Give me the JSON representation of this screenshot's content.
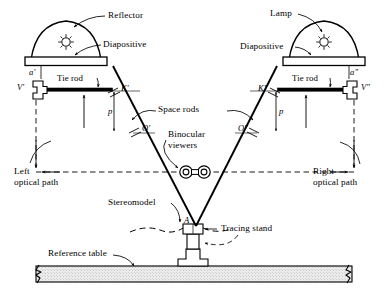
{
  "figure": {
    "background_color": "#ffffff",
    "ink_color": "#000000",
    "table_fill_color": "#e8e8e8"
  },
  "callouts": {
    "reflector": "Reflector",
    "lamp": "Lamp",
    "diapositive_left": "Diapositive",
    "diapositive_right": "Diapositive",
    "tie_rod_left": "Tie rod",
    "tie_rod_right": "Tie rod",
    "space_rods": "Space rods",
    "binocular_viewers_line1": "Binocular",
    "binocular_viewers_line2": "viewers",
    "left_optical_path_line1": "Left",
    "left_optical_path_line2": "optical path",
    "right_optical_path_line1": "Right",
    "right_optical_path_line2": "optical path",
    "stereomodel": "Stereomodel",
    "tracing_stand": "Tracing stand",
    "reference_table": "Reference table"
  },
  "point_labels": {
    "a_left": "a'",
    "a_right": "a\"",
    "v_left": "V'",
    "v_right": "V\"",
    "k_left": "K'",
    "k_right": "K\"",
    "o_left": "O'",
    "o_right": "O\"",
    "p_left": "p",
    "p_right": "p",
    "model_point_a": "A"
  }
}
